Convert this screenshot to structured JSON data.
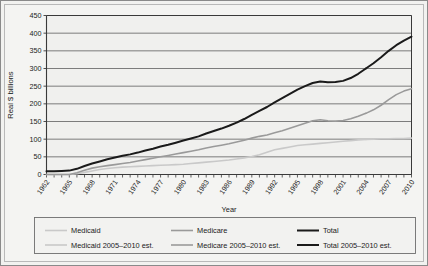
{
  "chart_data": {
    "type": "line",
    "title": "",
    "xlabel": "Year",
    "ylabel": "Real $ billions",
    "ylim": [
      0,
      450
    ],
    "ytick_step": 50,
    "yticks": [
      0,
      50,
      100,
      150,
      200,
      250,
      300,
      350,
      400,
      450
    ],
    "xlim": [
      1962,
      2010
    ],
    "xticks": [
      1962,
      1965,
      1968,
      1971,
      1974,
      1977,
      1980,
      1983,
      1986,
      1989,
      1992,
      1995,
      1998,
      2001,
      2004,
      2007,
      2010
    ],
    "grid": "horizontal",
    "legend_position": "bottom",
    "x": [
      1962,
      1963,
      1964,
      1965,
      1966,
      1967,
      1968,
      1969,
      1970,
      1971,
      1972,
      1973,
      1974,
      1975,
      1976,
      1977,
      1978,
      1979,
      1980,
      1981,
      1982,
      1983,
      1984,
      1985,
      1986,
      1987,
      1988,
      1989,
      1990,
      1991,
      1992,
      1993,
      1994,
      1995,
      1996,
      1997,
      1998,
      1999,
      2000,
      2001,
      2002,
      2003,
      2004,
      2005,
      2006,
      2007,
      2008,
      2009,
      2010
    ],
    "series": [
      {
        "name": "Medicaid",
        "color": "#c9c9c9",
        "width": 1.6,
        "segment": "actual",
        "values": [
          0,
          0,
          0,
          0,
          2,
          6,
          10,
          14,
          17,
          19,
          21,
          22,
          23,
          24,
          25,
          26,
          27,
          28,
          29,
          31,
          33,
          35,
          37,
          39,
          41,
          44,
          47,
          51,
          56,
          63,
          70,
          74,
          78,
          82,
          84,
          86,
          88,
          90,
          92,
          94,
          96,
          98,
          99,
          null,
          null,
          null,
          null,
          null,
          null
        ]
      },
      {
        "name": "Medicare",
        "color": "#9a9a9a",
        "width": 1.6,
        "segment": "actual",
        "values": [
          0,
          0,
          0,
          0,
          5,
          12,
          18,
          22,
          25,
          28,
          31,
          34,
          38,
          42,
          46,
          50,
          54,
          58,
          62,
          66,
          70,
          75,
          79,
          83,
          87,
          92,
          97,
          103,
          108,
          112,
          118,
          124,
          131,
          138,
          145,
          152,
          155,
          152,
          151,
          153,
          158,
          165,
          173,
          null,
          null,
          null,
          null,
          null,
          null
        ]
      },
      {
        "name": "Total",
        "color": "#1a1a1a",
        "width": 2.0,
        "segment": "actual",
        "values": [
          9,
          9,
          10,
          11,
          16,
          24,
          31,
          37,
          43,
          48,
          53,
          57,
          62,
          68,
          73,
          79,
          84,
          90,
          96,
          102,
          108,
          116,
          123,
          130,
          138,
          147,
          157,
          169,
          180,
          191,
          204,
          216,
          228,
          240,
          250,
          259,
          263,
          261,
          262,
          265,
          273,
          285,
          300,
          null,
          null,
          null,
          null,
          null,
          null
        ]
      },
      {
        "name": "Medicaid 2005–2010 est.",
        "color": "#c9c9c9",
        "width": 1.6,
        "segment": "estimate",
        "values": [
          null,
          null,
          null,
          null,
          null,
          null,
          null,
          null,
          null,
          null,
          null,
          null,
          null,
          null,
          null,
          null,
          null,
          null,
          null,
          null,
          null,
          null,
          null,
          null,
          null,
          null,
          null,
          null,
          null,
          null,
          null,
          null,
          null,
          null,
          null,
          null,
          null,
          null,
          null,
          null,
          null,
          null,
          99,
          100,
          101,
          101,
          102,
          102,
          103
        ]
      },
      {
        "name": "Medicare 2005–2010 est.",
        "color": "#9a9a9a",
        "width": 1.6,
        "segment": "estimate",
        "values": [
          null,
          null,
          null,
          null,
          null,
          null,
          null,
          null,
          null,
          null,
          null,
          null,
          null,
          null,
          null,
          null,
          null,
          null,
          null,
          null,
          null,
          null,
          null,
          null,
          null,
          null,
          null,
          null,
          null,
          null,
          null,
          null,
          null,
          null,
          null,
          null,
          null,
          null,
          null,
          null,
          null,
          null,
          173,
          183,
          196,
          212,
          226,
          236,
          243
        ]
      },
      {
        "name": "Total 2005–2010 est.",
        "color": "#1a1a1a",
        "width": 2.0,
        "segment": "estimate",
        "values": [
          null,
          null,
          null,
          null,
          null,
          null,
          null,
          null,
          null,
          null,
          null,
          null,
          null,
          null,
          null,
          null,
          null,
          null,
          null,
          null,
          null,
          null,
          null,
          null,
          null,
          null,
          null,
          null,
          null,
          null,
          null,
          null,
          null,
          null,
          null,
          null,
          null,
          null,
          null,
          null,
          null,
          null,
          300,
          315,
          332,
          350,
          366,
          379,
          390
        ]
      }
    ],
    "legend": [
      {
        "label": "Medicaid",
        "color": "#c9c9c9",
        "width": 1.6
      },
      {
        "label": "Medicare",
        "color": "#9a9a9a",
        "width": 1.6
      },
      {
        "label": "Total",
        "color": "#1a1a1a",
        "width": 2.0
      },
      {
        "label": "Medicaid 2005–2010 est.",
        "color": "#c9c9c9",
        "width": 1.6
      },
      {
        "label": "Medicare 2005–2010 est.",
        "color": "#9a9a9a",
        "width": 1.6
      },
      {
        "label": "Total 2005–2010 est.",
        "color": "#1a1a1a",
        "width": 2.0
      }
    ]
  },
  "colors": {
    "plot_background": "#f0f0ee",
    "grid": "#6e6e6e",
    "axis": "#3a3a3a",
    "frame": "#8a8a8a",
    "panel": "#f2f2f0"
  }
}
